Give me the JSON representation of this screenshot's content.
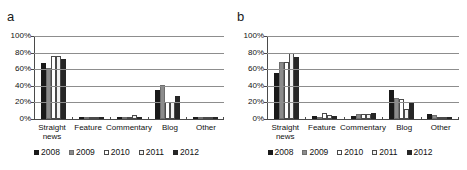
{
  "figure": {
    "panels": [
      {
        "label": "a",
        "name": "panel-a"
      },
      {
        "label": "b",
        "name": "panel-b"
      }
    ]
  },
  "legend": {
    "position": "bottom-center",
    "entries": [
      {
        "label": "2008",
        "color": "#1a1a1a",
        "border": "#1a1a1a"
      },
      {
        "label": "2009",
        "color": "#8c8c8c",
        "border": "#6e6e6e"
      },
      {
        "label": "2010",
        "color": "#ffffff",
        "border": "#4a4a4a"
      },
      {
        "label": "2011",
        "color": "#f2f2f2",
        "border": "#4a4a4a"
      },
      {
        "label": "2012",
        "color": "#262626",
        "border": "#262626"
      }
    ]
  },
  "axis": {
    "y_ticks": [
      "0%",
      "20%",
      "40%",
      "60%",
      "80%",
      "100%"
    ],
    "y_tick_values": [
      0,
      20,
      40,
      60,
      80,
      100
    ],
    "ylim": [
      0,
      100
    ],
    "grid": true
  },
  "chart_data": [
    {
      "type": "bar",
      "title": "a",
      "xlabel": "",
      "ylabel": "",
      "ylim": [
        0,
        100
      ],
      "grid": true,
      "legend_position": "bottom",
      "categories": [
        "Straight news",
        "Feature",
        "Commentary",
        "Blog",
        "Other"
      ],
      "series": [
        {
          "name": "2008",
          "values": [
            67,
            0,
            0,
            35,
            0
          ]
        },
        {
          "name": "2009",
          "values": [
            61,
            0,
            1,
            41,
            1
          ]
        },
        {
          "name": "2010",
          "values": [
            76,
            3,
            2,
            21,
            2
          ]
        },
        {
          "name": "2011",
          "values": [
            76,
            3,
            5,
            21,
            2
          ]
        },
        {
          "name": "2012",
          "values": [
            72,
            0,
            0,
            28,
            3
          ]
        }
      ]
    },
    {
      "type": "bar",
      "title": "b",
      "xlabel": "",
      "ylabel": "",
      "ylim": [
        0,
        100
      ],
      "grid": true,
      "legend_position": "bottom",
      "categories": [
        "Straight news",
        "Feature",
        "Commentary",
        "Blog",
        "Other"
      ],
      "series": [
        {
          "name": "2008",
          "values": [
            55,
            4,
            4,
            35,
            6
          ]
        },
        {
          "name": "2009",
          "values": [
            69,
            3,
            6,
            25,
            5
          ]
        },
        {
          "name": "2010",
          "values": [
            69,
            7,
            6,
            24,
            2
          ]
        },
        {
          "name": "2011",
          "values": [
            79,
            5,
            6,
            12,
            2
          ]
        },
        {
          "name": "2012",
          "values": [
            75,
            4,
            7,
            19,
            1
          ]
        }
      ]
    }
  ],
  "xlabels": {
    "straight_news_line1": "Straight",
    "straight_news_line2": "news",
    "feature": "Feature",
    "commentary": "Commentary",
    "blog": "Blog",
    "other": "Other"
  }
}
